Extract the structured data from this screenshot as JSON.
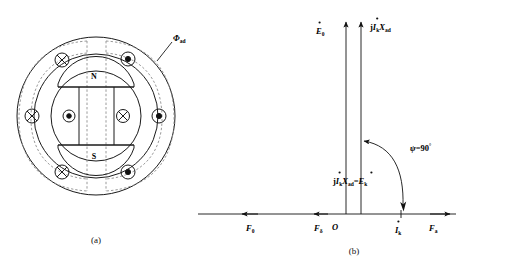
{
  "figure": {
    "title": "",
    "panels": [
      {
        "id": "a",
        "caption": "(a)",
        "name": "machine-cross-section",
        "rotor_poles": {
          "north": "N",
          "south": "S"
        },
        "flux_label": "Φ",
        "flux_sub": "ad",
        "conductor_symbols": [
          {
            "type": "cross",
            "position": "upper-left"
          },
          {
            "type": "dot",
            "position": "upper-right"
          },
          {
            "type": "cross",
            "position": "left"
          },
          {
            "type": "dot",
            "position": "right"
          },
          {
            "type": "cross",
            "position": "lower-left"
          },
          {
            "type": "dot",
            "position": "lower-right"
          },
          {
            "type": "dot",
            "position": "rotor-left"
          },
          {
            "type": "cross",
            "position": "rotor-right"
          }
        ]
      },
      {
        "id": "b",
        "caption": "(b)",
        "name": "phasor-diagram",
        "origin_label": "O",
        "vertical_vectors": [
          {
            "name": "E0",
            "base": "E",
            "dot": true,
            "sub": "0",
            "prefix": "",
            "suffix": ""
          },
          {
            "name": "jIkXad",
            "base": "I",
            "dot": true,
            "sub": "k",
            "prefix": "j",
            "suffix": "X",
            "suffix_sub": "ad"
          }
        ],
        "inner_label": {
          "text": "jİₖXₐₔ=Ėₖ",
          "parts": {
            "j": "j",
            "I": "I",
            "I_sub": "k",
            "X": "X",
            "X_sub": "ad",
            "eq": "=",
            "E": "E",
            "E_sub": "k"
          }
        },
        "angle_label": {
          "symbol": "ψ",
          "eq": "=",
          "value": "90",
          "unit": "°"
        },
        "axis_labels": [
          {
            "name": "F0",
            "base": "F",
            "sub": "0",
            "x_px": 22
          },
          {
            "name": "Fdelta",
            "base": "F",
            "sub": "δ",
            "x_px": 82
          },
          {
            "name": "Ik",
            "base": "I",
            "sub": "k",
            "dot": true,
            "x_px": 185
          },
          {
            "name": "Fa",
            "base": "F",
            "sub": "a",
            "x_px": 232
          }
        ]
      }
    ]
  },
  "colors": {
    "stroke": "#1a1a1a",
    "dashed": "#8a8a8a",
    "background": "#ffffff",
    "text": "#000000"
  }
}
